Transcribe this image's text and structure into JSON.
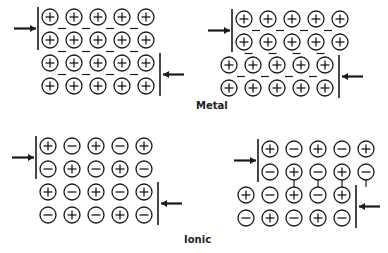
{
  "labels": {
    "metal": "Metal",
    "ionic": "Ionic"
  },
  "colors": {
    "ink": "#1a1a1a",
    "background": "#ffffff"
  },
  "panels": [
    {
      "id": "metal-before",
      "origin": [
        50,
        17
      ],
      "shift": [
        0,
        0,
        0,
        0
      ],
      "rows": [
        [
          "+",
          "+",
          "+",
          "+",
          "+"
        ],
        [
          "+",
          "+",
          "+",
          "+",
          "+"
        ],
        [
          "+",
          "+",
          "+",
          "+",
          "+"
        ],
        [
          "+",
          "+",
          "+",
          "+",
          "+"
        ]
      ],
      "electrons": true,
      "bonds": false
    },
    {
      "id": "metal-after",
      "origin": [
        244,
        19
      ],
      "shift": [
        0,
        0,
        -15,
        -15
      ],
      "rows": [
        [
          "+",
          "+",
          "+",
          "+",
          "+"
        ],
        [
          "+",
          "+",
          "+",
          "+",
          "+"
        ],
        [
          "+",
          "+",
          "+",
          "+",
          "+"
        ],
        [
          "+",
          "+",
          "+",
          "+",
          "+"
        ]
      ],
      "electrons": true,
      "bonds": false
    },
    {
      "id": "ionic-before",
      "origin": [
        48,
        146
      ],
      "shift": [
        0,
        0,
        0,
        0
      ],
      "rows": [
        [
          "+",
          "-",
          "+",
          "-",
          "+"
        ],
        [
          "-",
          "+",
          "-",
          "+",
          "-"
        ],
        [
          "+",
          "-",
          "+",
          "-",
          "+"
        ],
        [
          "-",
          "+",
          "-",
          "+",
          "-"
        ]
      ],
      "electrons": false,
      "bonds": false
    },
    {
      "id": "ionic-after",
      "origin": [
        270,
        149
      ],
      "shift": [
        0,
        0,
        -24,
        -24
      ],
      "rows": [
        [
          "+",
          "-",
          "+",
          "-",
          "+"
        ],
        [
          "-",
          "+",
          "-",
          "+",
          "-"
        ],
        [
          "+",
          "-",
          "+",
          "-",
          "+"
        ],
        [
          "-",
          "+",
          "-",
          "+",
          "-"
        ]
      ],
      "electrons": false,
      "bonds": true
    }
  ]
}
